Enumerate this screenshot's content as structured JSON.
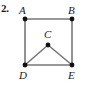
{
  "figure": {
    "problem_number": "2.",
    "stroke_color": "#777777",
    "vertex_color": "#111111",
    "label_color": "#1a1a1a",
    "background_color": "#ffffff",
    "vertices": [
      {
        "id": "A",
        "label": "A",
        "x": 25,
        "y": 19
      },
      {
        "id": "B",
        "label": "B",
        "x": 72,
        "y": 19
      },
      {
        "id": "C",
        "label": "C",
        "x": 48,
        "y": 45
      },
      {
        "id": "D",
        "label": "D",
        "x": 25,
        "y": 65
      },
      {
        "id": "E",
        "label": "E",
        "x": 72,
        "y": 65
      }
    ],
    "edges": [
      {
        "from": "A",
        "to": "B"
      },
      {
        "from": "A",
        "to": "D"
      },
      {
        "from": "B",
        "to": "E"
      },
      {
        "from": "D",
        "to": "E"
      },
      {
        "from": "D",
        "to": "C"
      },
      {
        "from": "C",
        "to": "E"
      }
    ]
  }
}
